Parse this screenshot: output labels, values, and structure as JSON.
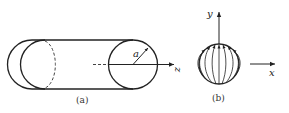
{
  "figure_a": {
    "caption": "(a)",
    "radius_label": "a",
    "axis_label": "z"
  },
  "figure_b": {
    "caption": "(b)",
    "y_axis_label": "y",
    "x_axis_label": "x"
  },
  "colors": {
    "stroke": "#222222",
    "background": "#ffffff"
  }
}
